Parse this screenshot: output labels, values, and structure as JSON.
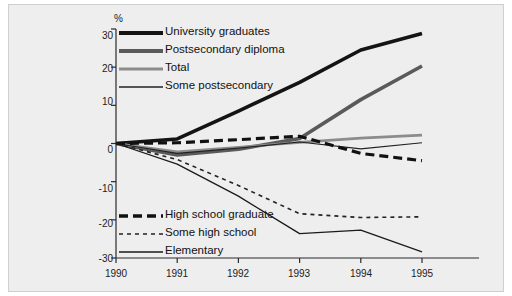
{
  "chart_data": {
    "type": "line",
    "title": "",
    "subtitle": "",
    "xlabel": "",
    "ylabel": "%",
    "unit_label": "%",
    "x": [
      1990,
      1991,
      1992,
      1993,
      1994,
      1995
    ],
    "xticklabels": [
      "1990",
      "1991",
      "1992",
      "1993",
      "1994",
      "1995"
    ],
    "yticklabels": [
      "30",
      "20",
      "10",
      "0",
      "-10",
      "-20",
      "-30"
    ],
    "yticks": [
      30,
      20,
      10,
      0,
      -10,
      -20,
      -30
    ],
    "xlim": [
      1990,
      1995
    ],
    "ylim": [
      -30,
      30
    ],
    "grid": false,
    "legend_position": "inside-upper-left-and-lower-left",
    "series": [
      {
        "name": "University graduates",
        "color": "#141414",
        "width": 3.6,
        "dash": "none",
        "values": [
          0,
          1.2,
          8.5,
          16.0,
          24.5,
          28.8
        ]
      },
      {
        "name": "Postsecondary diploma",
        "color": "#5a5a5a",
        "width": 3.6,
        "dash": "none",
        "values": [
          0,
          -3.0,
          -1.5,
          1.3,
          11.5,
          20.3
        ]
      },
      {
        "name": "Total",
        "color": "#8c8c8c",
        "width": 2.6,
        "dash": "none",
        "values": [
          0,
          -2.2,
          -1.0,
          0.3,
          1.4,
          2.2
        ]
      },
      {
        "name": "Some postsecondary",
        "color": "#222222",
        "width": 1.2,
        "dash": "none",
        "values": [
          0,
          -2.6,
          -1.2,
          0.4,
          -1.4,
          0.2
        ]
      },
      {
        "name": "High school graduate",
        "color": "#111111",
        "width": 3.2,
        "dash": "9 5",
        "values": [
          0,
          0.2,
          1.0,
          1.9,
          -2.6,
          -4.5
        ]
      },
      {
        "name": "Some high school",
        "color": "#222222",
        "width": 1.6,
        "dash": "4 4",
        "values": [
          0,
          -4.2,
          -11.0,
          -18.4,
          -19.4,
          -19.2
        ]
      },
      {
        "name": "Elementary",
        "color": "#1a1a1a",
        "width": 1.3,
        "dash": "none",
        "values": [
          0,
          -5.4,
          -13.8,
          -23.6,
          -22.7,
          -28.4
        ]
      }
    ],
    "legend_top": [
      {
        "label": "University graduates",
        "color": "#141414",
        "width": 4.2,
        "dash": "none"
      },
      {
        "label": "Postsecondary diploma",
        "color": "#5a5a5a",
        "width": 4.2,
        "dash": "none"
      },
      {
        "label": "Total",
        "color": "#8c8c8c",
        "width": 3.0,
        "dash": "none"
      },
      {
        "label": "Some postsecondary",
        "color": "#222222",
        "width": 1.4,
        "dash": "none"
      }
    ],
    "legend_bottom": [
      {
        "label": "High school graduate",
        "color": "#111111",
        "width": 3.4,
        "dash": "9 5"
      },
      {
        "label": "Some high school",
        "color": "#222222",
        "width": 1.7,
        "dash": "4 4"
      },
      {
        "label": "Elementary",
        "color": "#1a1a1a",
        "width": 1.4,
        "dash": "none"
      }
    ]
  }
}
